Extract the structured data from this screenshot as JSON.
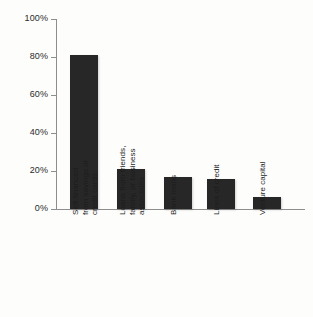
{
  "chart_data": {
    "type": "bar",
    "title": "",
    "subtitle": "",
    "xlabel": "",
    "ylabel": "",
    "categories": [
      "Self-financed\nfrom savings or\ncredit cards",
      "Loans from friends,\nfamily, or business\nassociates",
      "Bank loans",
      "Lines of credit",
      "Venture capital"
    ],
    "values": [
      81,
      21,
      17,
      16,
      6.5
    ],
    "value_labels": [
      "81%",
      "21%",
      "17%",
      "16%",
      "6.5%"
    ],
    "ylim": [
      0,
      100
    ],
    "y_ticks": [
      0,
      20,
      40,
      60,
      80,
      100
    ],
    "y_tick_labels": [
      "0%",
      "20%",
      "40%",
      "60%",
      "80%",
      "100%"
    ],
    "grid": false,
    "legend": null,
    "legend_position": "none",
    "bar_color": "#272727",
    "axis_color": "#8e8e8e",
    "background_color": "#fdfdfc",
    "annotations": []
  },
  "figure": {
    "axis_label_rotation": "vertical",
    "plot_background": "#fdfdfc"
  }
}
